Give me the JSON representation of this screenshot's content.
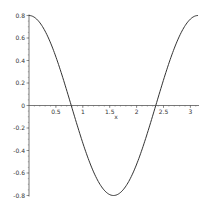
{
  "chart_data": {
    "type": "line",
    "title": "",
    "xlabel": "x",
    "ylabel": "",
    "xlim": [
      0,
      3.14159
    ],
    "ylim": [
      -0.8,
      0.8
    ],
    "grid": false,
    "legend": null,
    "function": "0.8*cos(2*x)",
    "x_ticks": [
      0.5,
      1,
      1.5,
      2,
      2.5,
      3
    ],
    "x_tick_labels": [
      "0.5",
      "1",
      "1.5",
      "2",
      "2.5",
      "3"
    ],
    "y_ticks": [
      0.8,
      0.6,
      0.4,
      0.2,
      0,
      -0.2,
      -0.4,
      -0.6,
      -0.8
    ],
    "y_tick_labels": [
      "0.8",
      "0.6",
      "0.4",
      "0.2",
      "0",
      "-0.2",
      "-0.4",
      "-0.6",
      "-0.8"
    ],
    "series": [
      {
        "name": "0.8*cos(2x)",
        "color": "#333333",
        "x": [
          0,
          0.25,
          0.5,
          0.785,
          1.0,
          1.25,
          1.5708,
          1.75,
          2.0,
          2.356,
          2.5,
          2.75,
          3.0,
          3.1416
        ],
        "y": [
          0.8,
          0.702,
          0.432,
          0.0,
          -0.333,
          -0.641,
          -0.8,
          -0.749,
          -0.523,
          0.0,
          0.227,
          0.567,
          0.768,
          0.8
        ]
      }
    ]
  },
  "layout": {
    "origin_px": [
      29,
      105.5
    ],
    "x_scale_px": 53.8,
    "y_scale_px": 112.5,
    "curve_color": "#333333",
    "axis_color": "#555555"
  }
}
